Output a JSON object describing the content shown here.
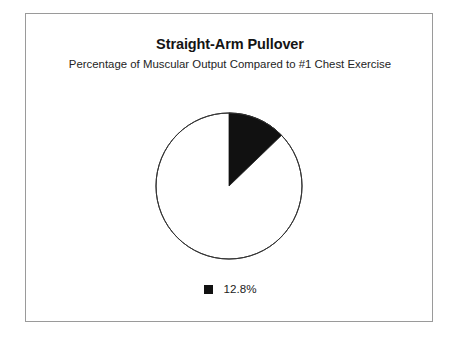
{
  "figure": {
    "title": "Straight-Arm Pullover",
    "subtitle": "Percentage of Muscular Output Compared to #1 Chest Exercise",
    "frame_color": "#9a9a9a",
    "background_color": "#ffffff"
  },
  "legend": {
    "items": [
      {
        "label": "12.8%",
        "swatch_icon": "filled-square-icon",
        "color": "#111111"
      }
    ]
  },
  "chart_data": {
    "type": "pie",
    "title": "Straight-Arm Pullover",
    "subtitle": "Percentage of Muscular Output Compared to #1 Chest Exercise",
    "categories": [
      "12.8%",
      ""
    ],
    "values": [
      12.8,
      87.2
    ],
    "labels": [
      "12.8%"
    ],
    "colors": [
      "#111111",
      "#ffffff"
    ],
    "start_angle_deg": 0,
    "direction": "clockwise",
    "slice_sweep_deg": 46.08,
    "outline_color": "#333333",
    "legend_position": "bottom",
    "grid": false,
    "xlabel": "",
    "ylabel": ""
  }
}
